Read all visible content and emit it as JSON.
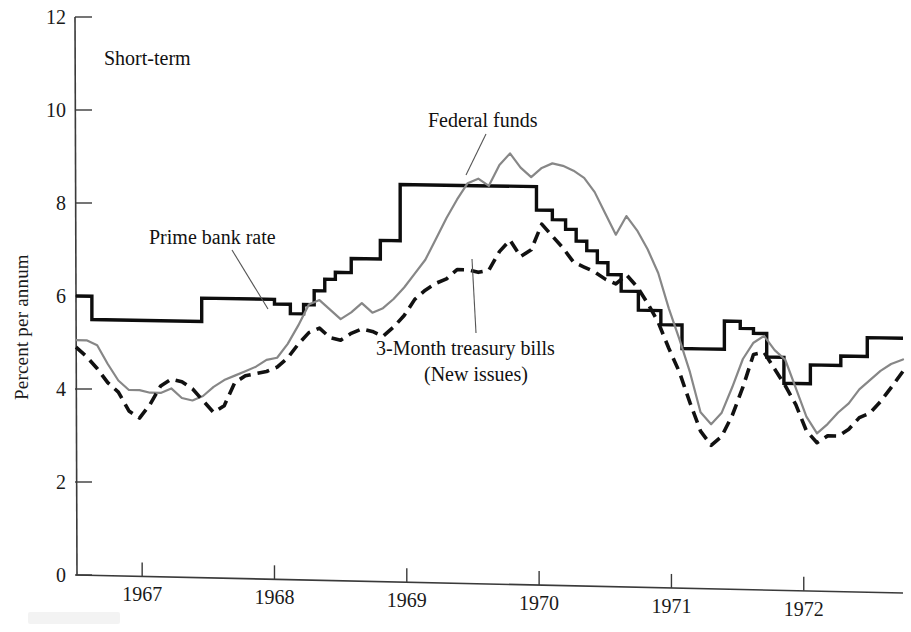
{
  "figure": {
    "panel_label": "Short-term",
    "ylabel": "Percent per annum"
  },
  "annotations": [
    {
      "id": "prime",
      "text": "Prime bank rate"
    },
    {
      "id": "fedfunds",
      "text": "Federal funds"
    },
    {
      "id": "tbills_line1",
      "text": "3-Month treasury bills"
    },
    {
      "id": "tbills_line2",
      "text": "(New issues)"
    }
  ],
  "colors": {
    "prime_bank_rate": "#0d0d0d",
    "federal_funds": "#878787",
    "treasury_bills": "#111111",
    "axis": "#3a3a3a",
    "background": "#ffffff"
  },
  "chart_data": {
    "type": "line",
    "title": "Short-term",
    "xlabel": "",
    "ylabel": "Percent per annum",
    "xlim": [
      1966.5,
      1972.75
    ],
    "ylim": [
      0,
      12
    ],
    "yticks": [
      0,
      2,
      4,
      6,
      8,
      10,
      12
    ],
    "xticks": [
      1967,
      1968,
      1969,
      1970,
      1971,
      1972
    ],
    "grid": false,
    "legend": "annotated-labels",
    "series": [
      {
        "name": "Prime bank rate",
        "style": "step",
        "color": "#0d0d0d",
        "x": [
          1966.5,
          1966.62,
          1966.62,
          1967.45,
          1967.45,
          1968.0,
          1968.0,
          1968.12,
          1968.12,
          1968.22,
          1968.22,
          1968.3,
          1968.3,
          1968.38,
          1968.38,
          1968.46,
          1968.46,
          1968.58,
          1968.58,
          1968.8,
          1968.8,
          1968.95,
          1968.95,
          1969.52,
          1969.52,
          1969.98,
          1969.98,
          1970.1,
          1970.1,
          1970.2,
          1970.2,
          1970.28,
          1970.28,
          1970.36,
          1970.36,
          1970.44,
          1970.44,
          1970.52,
          1970.52,
          1970.62,
          1970.62,
          1970.75,
          1970.75,
          1970.92,
          1970.92,
          1971.08,
          1971.08,
          1971.22,
          1971.22,
          1971.4,
          1971.4,
          1971.52,
          1971.52,
          1971.62,
          1971.62,
          1971.72,
          1971.72,
          1971.85,
          1971.85,
          1972.05,
          1972.05,
          1972.28,
          1972.28,
          1972.48,
          1972.48,
          1972.75
        ],
        "y": [
          6.0,
          6.0,
          5.5,
          5.5,
          6.0,
          6.0,
          5.9,
          5.9,
          5.7,
          5.7,
          5.9,
          5.9,
          6.2,
          6.2,
          6.45,
          6.45,
          6.6,
          6.6,
          6.9,
          6.9,
          7.3,
          7.3,
          8.5,
          8.5,
          8.5,
          8.5,
          8.0,
          8.0,
          7.8,
          7.8,
          7.6,
          7.6,
          7.35,
          7.35,
          7.15,
          7.15,
          6.9,
          6.9,
          6.65,
          6.65,
          6.3,
          6.3,
          5.9,
          5.9,
          5.6,
          5.6,
          5.1,
          5.1,
          5.1,
          5.1,
          5.7,
          5.7,
          5.55,
          5.55,
          5.45,
          5.45,
          4.95,
          4.95,
          4.4,
          4.4,
          4.8,
          4.8,
          5.0,
          5.0,
          5.4,
          5.4
        ]
      },
      {
        "name": "Federal funds",
        "style": "solid",
        "color": "#878787",
        "x": [
          1966.5,
          1966.58,
          1966.66,
          1966.74,
          1966.82,
          1966.9,
          1966.98,
          1967.06,
          1967.14,
          1967.22,
          1967.3,
          1967.38,
          1967.46,
          1967.54,
          1967.62,
          1967.7,
          1967.78,
          1967.86,
          1967.94,
          1968.02,
          1968.1,
          1968.18,
          1968.26,
          1968.34,
          1968.42,
          1968.5,
          1968.58,
          1968.66,
          1968.74,
          1968.82,
          1968.9,
          1968.98,
          1969.06,
          1969.14,
          1969.22,
          1969.3,
          1969.38,
          1969.46,
          1969.54,
          1969.62,
          1969.7,
          1969.78,
          1969.86,
          1969.94,
          1970.02,
          1970.1,
          1970.18,
          1970.26,
          1970.34,
          1970.42,
          1970.5,
          1970.58,
          1970.66,
          1970.74,
          1970.82,
          1970.9,
          1970.98,
          1971.06,
          1971.14,
          1971.22,
          1971.3,
          1971.38,
          1971.46,
          1971.54,
          1971.62,
          1971.7,
          1971.78,
          1971.86,
          1971.94,
          1972.02,
          1972.1,
          1972.18,
          1972.26,
          1972.34,
          1972.42,
          1972.5,
          1972.58,
          1972.66,
          1972.75
        ],
        "y": [
          5.05,
          5.05,
          4.95,
          4.55,
          4.2,
          4.0,
          4.0,
          3.95,
          3.95,
          4.05,
          3.85,
          3.8,
          3.9,
          4.1,
          4.25,
          4.35,
          4.45,
          4.55,
          4.7,
          4.75,
          5.05,
          5.45,
          5.9,
          6.0,
          5.8,
          5.6,
          5.75,
          5.95,
          5.75,
          5.85,
          6.05,
          6.3,
          6.6,
          6.9,
          7.35,
          7.8,
          8.2,
          8.55,
          8.65,
          8.5,
          8.95,
          9.2,
          8.9,
          8.7,
          8.9,
          9.0,
          8.95,
          8.85,
          8.7,
          8.4,
          7.95,
          7.5,
          7.9,
          7.6,
          7.2,
          6.7,
          5.95,
          5.3,
          4.6,
          3.75,
          3.5,
          3.75,
          4.3,
          4.9,
          5.25,
          5.4,
          5.1,
          4.9,
          4.3,
          3.7,
          3.35,
          3.55,
          3.8,
          4.0,
          4.3,
          4.5,
          4.7,
          4.85,
          4.95
        ]
      },
      {
        "name": "3-Month treasury bills (New issues)",
        "style": "dashed",
        "color": "#111111",
        "x": [
          1966.5,
          1966.58,
          1966.66,
          1966.74,
          1966.82,
          1966.9,
          1966.98,
          1967.06,
          1967.14,
          1967.22,
          1967.3,
          1967.38,
          1967.46,
          1967.54,
          1967.62,
          1967.7,
          1967.78,
          1967.86,
          1967.94,
          1968.02,
          1968.1,
          1968.18,
          1968.26,
          1968.34,
          1968.42,
          1968.5,
          1968.58,
          1968.66,
          1968.74,
          1968.82,
          1968.9,
          1968.98,
          1969.06,
          1969.14,
          1969.22,
          1969.3,
          1969.38,
          1969.46,
          1969.54,
          1969.62,
          1969.7,
          1969.78,
          1969.86,
          1969.94,
          1970.02,
          1970.1,
          1970.18,
          1970.26,
          1970.34,
          1970.42,
          1970.5,
          1970.58,
          1970.66,
          1970.74,
          1970.82,
          1970.9,
          1970.98,
          1971.06,
          1971.14,
          1971.22,
          1971.3,
          1971.38,
          1971.46,
          1971.54,
          1971.62,
          1971.7,
          1971.78,
          1971.86,
          1971.94,
          1972.02,
          1972.1,
          1972.18,
          1972.26,
          1972.34,
          1972.42,
          1972.5,
          1972.58,
          1972.66,
          1972.75
        ],
        "y": [
          4.9,
          4.7,
          4.45,
          4.15,
          3.95,
          3.55,
          3.4,
          3.7,
          4.1,
          4.25,
          4.2,
          4.05,
          3.8,
          3.55,
          3.7,
          4.2,
          4.35,
          4.4,
          4.45,
          4.55,
          4.75,
          5.05,
          5.3,
          5.4,
          5.2,
          5.15,
          5.3,
          5.4,
          5.35,
          5.25,
          5.45,
          5.7,
          6.05,
          6.25,
          6.4,
          6.5,
          6.7,
          6.7,
          6.65,
          6.7,
          7.1,
          7.35,
          7.0,
          7.15,
          7.7,
          7.45,
          7.2,
          6.9,
          6.8,
          6.7,
          6.55,
          6.45,
          6.65,
          6.4,
          6.05,
          5.65,
          5.1,
          4.6,
          3.95,
          3.35,
          3.05,
          3.25,
          3.7,
          4.3,
          5.0,
          5.05,
          4.7,
          4.35,
          3.95,
          3.4,
          3.15,
          3.3,
          3.3,
          3.45,
          3.7,
          3.8,
          4.05,
          4.35,
          4.7
        ]
      }
    ]
  }
}
